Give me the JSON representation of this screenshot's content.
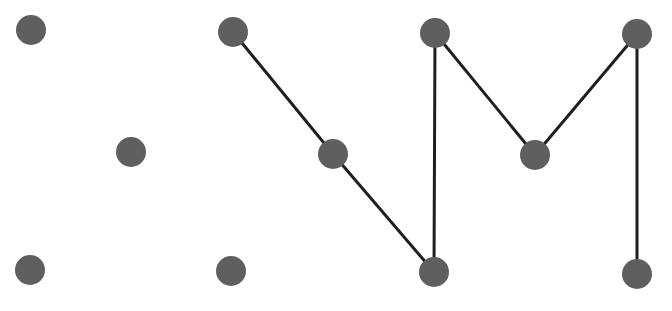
{
  "diagram": {
    "type": "graph",
    "canvas": {
      "width": 672,
      "height": 311,
      "background": "#ffffff"
    },
    "style": {
      "node_color": "#5f5f5f",
      "node_radius": 15,
      "edge_color": "#1f1f1f",
      "edge_width": 3
    },
    "nodes": [
      {
        "id": "n1",
        "row": "top",
        "x": 31,
        "y": 30
      },
      {
        "id": "n2",
        "row": "top",
        "x": 233,
        "y": 32
      },
      {
        "id": "n3",
        "row": "top",
        "x": 435,
        "y": 33
      },
      {
        "id": "n4",
        "row": "top",
        "x": 637,
        "y": 34
      },
      {
        "id": "n5",
        "row": "middle",
        "x": 131,
        "y": 152
      },
      {
        "id": "n6",
        "row": "middle",
        "x": 333,
        "y": 154
      },
      {
        "id": "n7",
        "row": "middle",
        "x": 535,
        "y": 155
      },
      {
        "id": "n8",
        "row": "bottom",
        "x": 30,
        "y": 270
      },
      {
        "id": "n9",
        "row": "bottom",
        "x": 231,
        "y": 271
      },
      {
        "id": "n10",
        "row": "bottom",
        "x": 434,
        "y": 272
      },
      {
        "id": "n11",
        "row": "bottom",
        "x": 637,
        "y": 274
      }
    ],
    "edges": [
      {
        "from": "n2",
        "to": "n6"
      },
      {
        "from": "n6",
        "to": "n10"
      },
      {
        "from": "n3",
        "to": "n10"
      },
      {
        "from": "n3",
        "to": "n7"
      },
      {
        "from": "n7",
        "to": "n4"
      },
      {
        "from": "n4",
        "to": "n11"
      }
    ]
  }
}
